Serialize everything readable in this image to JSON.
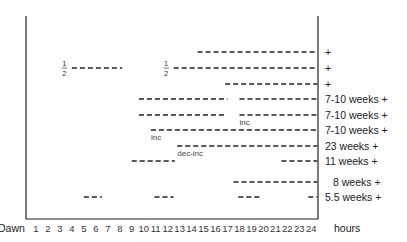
{
  "chart_data": {
    "type": "timeline",
    "title": "",
    "xlabel": "hours",
    "x_start_label": "Dawn",
    "x_ticks": [
      1,
      2,
      3,
      4,
      5,
      6,
      7,
      8,
      9,
      10,
      11,
      12,
      13,
      14,
      15,
      16,
      17,
      18,
      19,
      20,
      21,
      22,
      23,
      24
    ],
    "xlim": [
      0,
      24.5
    ],
    "grid": false,
    "rows": [
      {
        "label": "+",
        "segments": [
          [
            14.5,
            24.5
          ]
        ],
        "annotations": []
      },
      {
        "label": "+",
        "segments": [
          [
            4,
            8.2
          ],
          [
            12.5,
            24.5
          ]
        ],
        "annotations": [
          {
            "text": "1/2",
            "x": 3.2
          },
          {
            "text": "1/2",
            "x": 11.7
          }
        ]
      },
      {
        "label": "+",
        "segments": [
          [
            16.8,
            24.5
          ]
        ],
        "annotations": []
      },
      {
        "label": "7-10 weeks +",
        "segments": [
          [
            9.6,
            17.0
          ],
          [
            18.0,
            24.5
          ]
        ],
        "annotations": []
      },
      {
        "label": "7-10 weeks +",
        "segments": [
          [
            9.6,
            16.8
          ],
          [
            18.0,
            24.5
          ]
        ],
        "annotations": [
          {
            "text": "inc",
            "x": 18.0
          }
        ]
      },
      {
        "label": "7-10 weeks +",
        "segments": [
          [
            10.6,
            24.5
          ]
        ],
        "annotations": [
          {
            "text": "inc",
            "x": 10.6
          }
        ]
      },
      {
        "label": "23 weeks +",
        "segments": [
          [
            12.8,
            24.5
          ]
        ],
        "annotations": [
          {
            "text": "dec-inc",
            "x": 12.8
          }
        ]
      },
      {
        "label": "11 weeks +",
        "segments": [
          [
            9.0,
            12.6
          ],
          [
            21.5,
            24.5
          ]
        ],
        "annotations": []
      },
      {
        "label": "8 weeks +",
        "segments": [
          [
            17.5,
            24.5
          ]
        ],
        "annotations": []
      },
      {
        "label": "5.5 weeks +",
        "segments": [
          [
            5.0,
            6.5
          ],
          [
            10.9,
            12.5
          ],
          [
            17.9,
            19.7
          ],
          [
            23.75,
            24.5
          ]
        ],
        "annotations": []
      }
    ]
  },
  "axis": {
    "dawn_label": "Dawn",
    "hours_label": "hours"
  }
}
